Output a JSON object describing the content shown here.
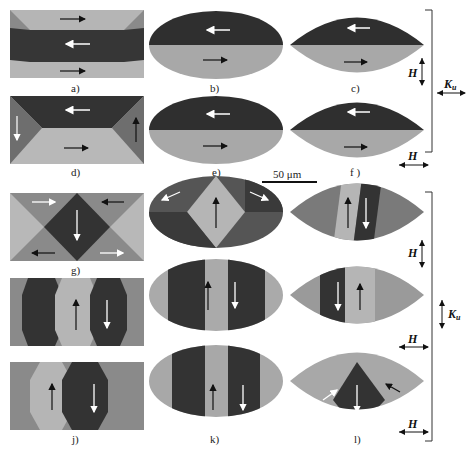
{
  "figure": {
    "panels": [
      {
        "id": "a",
        "label": "a)",
        "shape": "rectangle"
      },
      {
        "id": "b",
        "label": "b)",
        "shape": "ellipse"
      },
      {
        "id": "c",
        "label": "c)",
        "shape": "lens"
      },
      {
        "id": "d",
        "label": "d)",
        "shape": "rectangle"
      },
      {
        "id": "e",
        "label": "e)",
        "shape": "ellipse"
      },
      {
        "id": "f",
        "label": "f )",
        "shape": "lens"
      },
      {
        "id": "g",
        "label": "g)",
        "shape": "rectangle"
      },
      {
        "id": "h",
        "label": "h)",
        "shape": "ellipse"
      },
      {
        "id": "i",
        "label": "i)",
        "shape": "lens"
      },
      {
        "id": "j_top",
        "label": "",
        "shape": "rectangle"
      },
      {
        "id": "k_top",
        "label": "",
        "shape": "ellipse"
      },
      {
        "id": "l_top",
        "label": "",
        "shape": "lens"
      },
      {
        "id": "j",
        "label": "j)",
        "shape": "rectangle"
      },
      {
        "id": "k",
        "label": "k)",
        "shape": "ellipse"
      },
      {
        "id": "l",
        "label": "l)",
        "shape": "lens"
      }
    ],
    "scale_bar": {
      "label": "50 μm"
    },
    "field_labels": {
      "H": "H",
      "Ku": "K",
      "Ku_sub": "u"
    },
    "colors": {
      "dark": "#3a3a3a",
      "mid": "#7a7a7a",
      "light": "#b8b8b8",
      "bg": "#ffffff"
    }
  }
}
